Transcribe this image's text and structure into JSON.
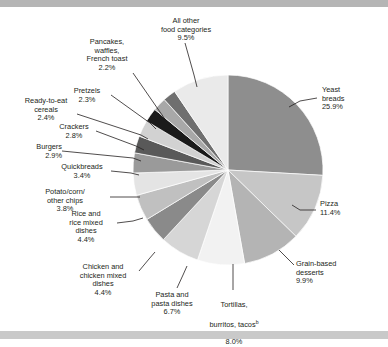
{
  "chart_data": {
    "type": "pie",
    "title": "",
    "subtitle": "",
    "xlabel": "",
    "ylabel": "",
    "legend_position": "none",
    "labels_style": "callout-leader-lines",
    "categories": [
      "Yeast breads",
      "Pizza",
      "Grain-based desserts",
      "Tortillas, burritos, tacos",
      "Pasta and pasta dishes",
      "Chicken and chicken mixed dishes",
      "Rice and rice mixed dishes",
      "Potato/corn/other chips",
      "Quickbreads",
      "Burgers",
      "Crackers",
      "Ready-to-eat cereals",
      "Pretzels",
      "Pancakes, waffles, French toast",
      "All other food categories"
    ],
    "values": [
      25.9,
      11.4,
      9.9,
      8.0,
      6.7,
      4.4,
      4.4,
      3.8,
      3.4,
      2.9,
      2.8,
      2.4,
      2.3,
      2.2,
      9.5
    ],
    "value_suffix": "%",
    "colors": [
      "#8e8e8e",
      "#c6c6c6",
      "#b4b4b4",
      "#f2f2f2",
      "#d6d6d6",
      "#8a8a8a",
      "#c0c0c0",
      "#e4e4e4",
      "#9a9a9a",
      "#595959",
      "#d2d2d2",
      "#1a1a1a",
      "#a8a8a8",
      "#6f6f6f",
      "#eaeaea"
    ],
    "footnote_marker": "b",
    "footnote_marker_on": "Tortillas, burritos, tacos"
  },
  "slices": [
    {
      "name": "Yeast breads",
      "label": "Yeast\nbreads\n25.9%",
      "percent": "25.9%"
    },
    {
      "name": "Pizza",
      "label": "Pizza\n11.4%",
      "percent": "11.4%"
    },
    {
      "name": "Grain-based desserts",
      "label": "Grain-based\ndesserts\n9.9%",
      "percent": "9.9%"
    },
    {
      "name": "Tortillas, burritos, tacos",
      "label_line1": "Tortillas,",
      "label_line2": "burritos, tacos",
      "marker": "b",
      "label_line3": "8.0%",
      "percent": "8.0%"
    },
    {
      "name": "Pasta and pasta dishes",
      "label": "Pasta and\npasta dishes\n6.7%",
      "percent": "6.7%"
    },
    {
      "name": "Chicken and chicken mixed dishes",
      "label": "Chicken and\nchicken mixed\ndishes\n4.4%",
      "percent": "4.4%"
    },
    {
      "name": "Rice and rice mixed dishes",
      "label": "Rice and\nrice mixed\ndishes\n4.4%",
      "percent": "4.4%"
    },
    {
      "name": "Potato/corn/other chips",
      "label": "Potato/corn/\nother chips\n3.8%",
      "percent": "3.8%"
    },
    {
      "name": "Quickbreads",
      "label": "Quickbreads\n3.4%",
      "percent": "3.4%"
    },
    {
      "name": "Burgers",
      "label": "Burgers\n2.9%",
      "percent": "2.9%"
    },
    {
      "name": "Crackers",
      "label": "Crackers\n2.8%",
      "percent": "2.8%"
    },
    {
      "name": "Ready-to-eat cereals",
      "label": "Ready-to-eat\ncereals\n2.4%",
      "percent": "2.4%"
    },
    {
      "name": "Pretzels",
      "label": "Pretzels\n2.3%",
      "percent": "2.3%"
    },
    {
      "name": "Pancakes, waffles, French toast",
      "label": "Pancakes,\nwaffles,\nFrench toast\n2.2%",
      "percent": "2.2%"
    },
    {
      "name": "All other food categories",
      "label": "All other\nfood categories\n9.5%",
      "percent": "9.5%"
    }
  ]
}
